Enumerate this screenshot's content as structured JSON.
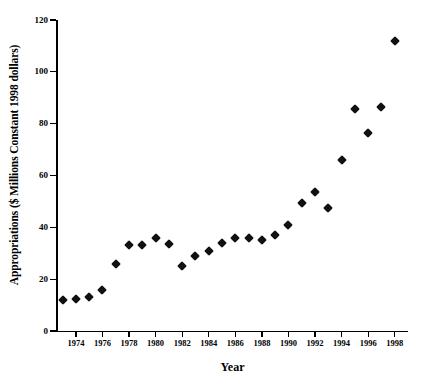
{
  "chart_data": {
    "type": "scatter",
    "title": "",
    "xlabel": "Year",
    "ylabel": "Appropriations ($ Millions Constant 1998 dollars)",
    "xlim": [
      1972.5,
      1999
    ],
    "ylim": [
      0,
      120
    ],
    "xticks": [
      1974,
      1976,
      1978,
      1980,
      1982,
      1984,
      1986,
      1988,
      1990,
      1992,
      1994,
      1996,
      1998
    ],
    "yticks": [
      0,
      20,
      40,
      60,
      80,
      100,
      120
    ],
    "grid": false,
    "legend": null,
    "marker": "diamond",
    "marker_color": "#111111",
    "x": [
      1973,
      1974,
      1975,
      1976,
      1977,
      1978,
      1979,
      1980,
      1981,
      1982,
      1983,
      1984,
      1985,
      1986,
      1987,
      1988,
      1989,
      1990,
      1991,
      1992,
      1993,
      1994,
      1995,
      1996,
      1997,
      1998
    ],
    "values": [
      12,
      12.5,
      13,
      16,
      26,
      33,
      33,
      36,
      33.5,
      25,
      29,
      31,
      34,
      36,
      36,
      35,
      37,
      41,
      49.5,
      53.5,
      47.5,
      66,
      85.5,
      76.5,
      86.5,
      112
    ]
  }
}
